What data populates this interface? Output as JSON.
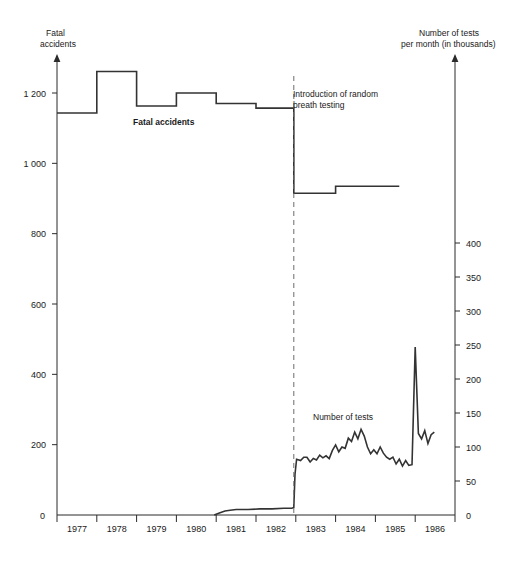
{
  "chart_data": {
    "type": "line",
    "title": "",
    "subtitle": "",
    "left_axis": {
      "label_line1": "Fatal",
      "label_line2": "accidents",
      "ticks": [
        0,
        200,
        400,
        600,
        800,
        1000,
        1200
      ],
      "tick_labels": [
        "0",
        "200",
        "400",
        "600",
        "800",
        "1 000",
        "1 200"
      ],
      "ylim": [
        0,
        1350
      ],
      "grid": false
    },
    "right_axis": {
      "label_line1": "Number of tests",
      "label_line2": "per month (in thousands)",
      "ticks": [
        0,
        50,
        100,
        150,
        200,
        250,
        300,
        350,
        400
      ],
      "tick_labels": [
        "0",
        "50",
        "100",
        "150",
        "200",
        "250",
        "300",
        "350",
        "400"
      ],
      "ylim": [
        0,
        475
      ],
      "grid": false
    },
    "xlabel": "",
    "x_tick_labels": [
      "1977",
      "1978",
      "1979",
      "1980",
      "1981",
      "1982",
      "1983",
      "1984",
      "1985",
      "1986"
    ],
    "xlim": [
      1976.5,
      1986.5
    ],
    "annotations": [
      {
        "name": "introduction-of-random-breath-testing",
        "line1": "Introduction of random",
        "line2": "breath testing",
        "x": 1982.45
      }
    ],
    "series": [
      {
        "name": "Fatal accidents",
        "label": "Fatal accidents",
        "axis": "left",
        "style": "step",
        "color": "#333333",
        "categories": [
          1977,
          1978,
          1979,
          1980,
          1981,
          1982,
          1983,
          1984,
          1985,
          1986
        ],
        "values": [
          1143,
          1261,
          1163,
          1200,
          1170,
          1157,
          915,
          935,
          935,
          935
        ],
        "step_points": [
          {
            "x": 1976.5,
            "y": 1143
          },
          {
            "x": 1977.5,
            "y": 1143
          },
          {
            "x": 1977.5,
            "y": 1261
          },
          {
            "x": 1978.5,
            "y": 1261
          },
          {
            "x": 1978.5,
            "y": 1163
          },
          {
            "x": 1979.5,
            "y": 1163
          },
          {
            "x": 1979.5,
            "y": 1200
          },
          {
            "x": 1980.5,
            "y": 1200
          },
          {
            "x": 1980.5,
            "y": 1170
          },
          {
            "x": 1981.5,
            "y": 1170
          },
          {
            "x": 1981.5,
            "y": 1157
          },
          {
            "x": 1982.45,
            "y": 1157
          },
          {
            "x": 1982.45,
            "y": 915
          },
          {
            "x": 1983.5,
            "y": 915
          },
          {
            "x": 1983.5,
            "y": 935
          },
          {
            "x": 1985.1,
            "y": 935
          }
        ]
      },
      {
        "name": "Number of tests",
        "label": "Number of tests",
        "axis": "right",
        "style": "line",
        "color": "#333333",
        "points": [
          {
            "x": 1980.45,
            "y": 0
          },
          {
            "x": 1980.58,
            "y": 3
          },
          {
            "x": 1980.72,
            "y": 6
          },
          {
            "x": 1980.85,
            "y": 7
          },
          {
            "x": 1981.0,
            "y": 8
          },
          {
            "x": 1981.3,
            "y": 8
          },
          {
            "x": 1981.6,
            "y": 9
          },
          {
            "x": 1981.9,
            "y": 9
          },
          {
            "x": 1982.2,
            "y": 10
          },
          {
            "x": 1982.4,
            "y": 10
          },
          {
            "x": 1982.45,
            "y": 11
          },
          {
            "x": 1982.48,
            "y": 60
          },
          {
            "x": 1982.52,
            "y": 82
          },
          {
            "x": 1982.62,
            "y": 80
          },
          {
            "x": 1982.7,
            "y": 85
          },
          {
            "x": 1982.78,
            "y": 85
          },
          {
            "x": 1982.86,
            "y": 78
          },
          {
            "x": 1982.94,
            "y": 83
          },
          {
            "x": 1983.02,
            "y": 81
          },
          {
            "x": 1983.1,
            "y": 88
          },
          {
            "x": 1983.18,
            "y": 84
          },
          {
            "x": 1983.26,
            "y": 87
          },
          {
            "x": 1983.34,
            "y": 83
          },
          {
            "x": 1983.42,
            "y": 95
          },
          {
            "x": 1983.5,
            "y": 103
          },
          {
            "x": 1983.58,
            "y": 93
          },
          {
            "x": 1983.66,
            "y": 100
          },
          {
            "x": 1983.74,
            "y": 98
          },
          {
            "x": 1983.82,
            "y": 113
          },
          {
            "x": 1983.9,
            "y": 108
          },
          {
            "x": 1983.98,
            "y": 122
          },
          {
            "x": 1984.06,
            "y": 112
          },
          {
            "x": 1984.14,
            "y": 126
          },
          {
            "x": 1984.22,
            "y": 116
          },
          {
            "x": 1984.3,
            "y": 100
          },
          {
            "x": 1984.38,
            "y": 90
          },
          {
            "x": 1984.46,
            "y": 96
          },
          {
            "x": 1984.54,
            "y": 90
          },
          {
            "x": 1984.62,
            "y": 100
          },
          {
            "x": 1984.7,
            "y": 91
          },
          {
            "x": 1984.78,
            "y": 85
          },
          {
            "x": 1984.86,
            "y": 82
          },
          {
            "x": 1984.94,
            "y": 85
          },
          {
            "x": 1985.02,
            "y": 75
          },
          {
            "x": 1985.1,
            "y": 82
          },
          {
            "x": 1985.18,
            "y": 72
          },
          {
            "x": 1985.26,
            "y": 80
          },
          {
            "x": 1985.34,
            "y": 73
          },
          {
            "x": 1985.42,
            "y": 74
          },
          {
            "x": 1985.5,
            "y": 247
          },
          {
            "x": 1985.58,
            "y": 120
          },
          {
            "x": 1985.66,
            "y": 112
          },
          {
            "x": 1985.74,
            "y": 124
          },
          {
            "x": 1985.82,
            "y": 105
          },
          {
            "x": 1985.9,
            "y": 118
          },
          {
            "x": 1985.98,
            "y": 122
          }
        ]
      }
    ]
  }
}
